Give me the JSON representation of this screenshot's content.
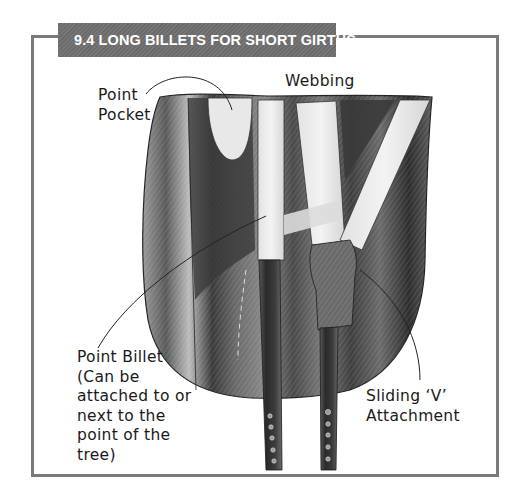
{
  "figure": {
    "title": "9.4 LONG BILLETS FOR SHORT GIRTHS",
    "colors": {
      "title_tab": "#6f6f6f",
      "frame_border": "#7a7a7a",
      "title_text": "#ffffff",
      "label_text": "#1a1a1a"
    },
    "labels": {
      "point_pocket": "Point\nPocket",
      "webbing": "Webbing",
      "point_billet": "Point Billet\n(Can be\nattached to or\nnext to the\npoint of the\ntree)",
      "sliding_v": "Sliding ‘V’\nAttachment"
    }
  }
}
